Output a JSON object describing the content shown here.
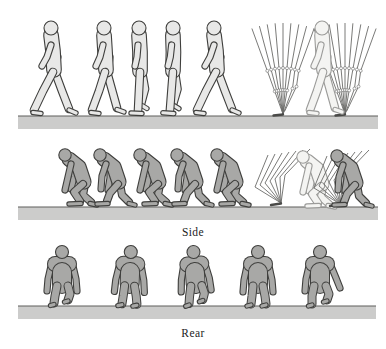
{
  "figure": {
    "labels": {
      "side": "Side",
      "rear": "Rear"
    },
    "rows": [
      {
        "name": "human-walking-side-view",
        "frames": 5,
        "has_stick_diagram": true,
        "stick_style": "straight-leg-strut"
      },
      {
        "name": "chimpanzee-walking-side-view",
        "frames": 5,
        "has_stick_diagram": true,
        "stick_style": "bent-hip-bent-knee-zigzag"
      },
      {
        "name": "chimpanzee-walking-rear-view",
        "frames": 5,
        "has_stick_diagram": false
      }
    ]
  },
  "labels": {
    "side": "Side",
    "rear": "Rear"
  },
  "colors": {
    "background": "#ffffff",
    "human_fill": "#e8e8e7",
    "chimp_fill": "#a8a8a6",
    "ghost_fill": "#f4f4f2",
    "ghost_outline": "#9b9b99",
    "outline": "#3f3f3d",
    "ground_fill": "#cccccb",
    "ground_line": "#5e5e5c",
    "stick_line": "#6b6b69",
    "joint_fill": "#ffffff"
  }
}
